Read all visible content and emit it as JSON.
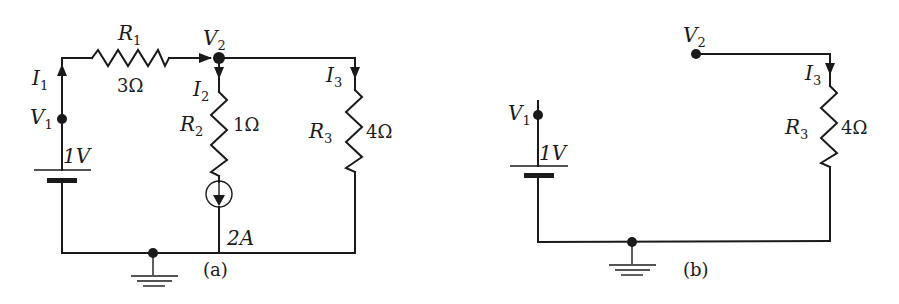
{
  "diagram": {
    "type": "circuit",
    "panels": [
      {
        "caption": "(a)",
        "nodes": [
          {
            "name": "V",
            "sub": "1"
          },
          {
            "name": "V",
            "sub": "2"
          }
        ],
        "components": {
          "R1": {
            "name": "R",
            "sub": "1",
            "value": "3Ω"
          },
          "R2": {
            "name": "R",
            "sub": "2",
            "value": "1Ω"
          },
          "R3": {
            "name": "R",
            "sub": "3",
            "value": "4Ω"
          },
          "battery": {
            "value": "1V"
          },
          "current_source": {
            "value": "2A"
          }
        },
        "currents": [
          {
            "name": "I",
            "sub": "1"
          },
          {
            "name": "I",
            "sub": "2"
          },
          {
            "name": "I",
            "sub": "3"
          }
        ]
      },
      {
        "caption": "(b)",
        "nodes": [
          {
            "name": "V",
            "sub": "1"
          },
          {
            "name": "V",
            "sub": "2"
          }
        ],
        "components": {
          "R3": {
            "name": "R",
            "sub": "3",
            "value": "4Ω"
          },
          "battery": {
            "value": "1V"
          }
        },
        "currents": [
          {
            "name": "I",
            "sub": "3"
          }
        ]
      }
    ]
  }
}
